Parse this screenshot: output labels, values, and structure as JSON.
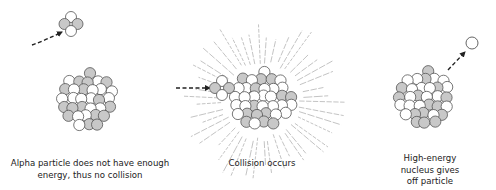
{
  "diagram": {
    "colors": {
      "proton_fill": "#c8c8c8",
      "neutron_fill": "#ffffff",
      "outline": "#555555",
      "arrow": "#222222",
      "rays": "#9a9a9a",
      "text": "#222222"
    },
    "panels": [
      {
        "id": "no-collision",
        "caption_lines": [
          "Alpha particle does not have enough",
          "energy, thus no collision"
        ]
      },
      {
        "id": "collision",
        "caption_lines": [
          "Collision occurs"
        ]
      },
      {
        "id": "particle-emission",
        "caption_lines": [
          "High-energy",
          "nucleus gives",
          "off particle"
        ]
      }
    ]
  }
}
